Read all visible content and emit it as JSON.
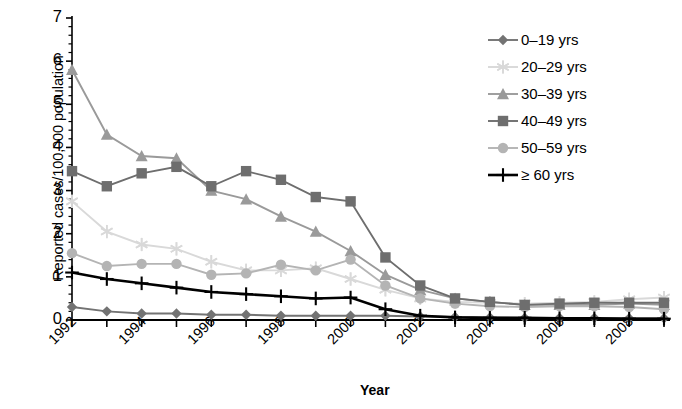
{
  "chart_data": {
    "type": "line",
    "title": "",
    "xlabel": "Year",
    "ylabel": "Reported cases/100,000 population",
    "x": [
      1992,
      1993,
      1994,
      1995,
      1996,
      1997,
      1998,
      1999,
      2000,
      2001,
      2002,
      2003,
      2004,
      2005,
      2006,
      2007,
      2008,
      2009
    ],
    "xlim": [
      1992,
      2009
    ],
    "ylim": [
      0,
      7
    ],
    "yticks": [
      0,
      1,
      2,
      3,
      4,
      5,
      6,
      7
    ],
    "ytick_labels": [
      "0",
      "1",
      "2",
      "3",
      "4",
      "5",
      "6",
      "7"
    ],
    "xtick_labels": [
      "1992",
      "1994",
      "1996",
      "1998",
      "2000",
      "2002",
      "2004",
      "2006",
      "2008"
    ],
    "xtick_values": [
      1992,
      1994,
      1996,
      1998,
      2000,
      2002,
      2004,
      2006,
      2008
    ],
    "minor_ticks": true,
    "grid": false,
    "legend_position": "top-right",
    "series": [
      {
        "name": "0–19 yrs",
        "marker": "diamond",
        "color": "#737373",
        "values": [
          0.3,
          0.2,
          0.15,
          0.15,
          0.12,
          0.12,
          0.1,
          0.1,
          0.1,
          0.1,
          0.08,
          0.07,
          0.06,
          0.05,
          0.05,
          0.05,
          0.04,
          0.04
        ]
      },
      {
        "name": "20–29 yrs",
        "marker": "star",
        "color": "#d9d9d9",
        "values": [
          2.75,
          2.05,
          1.75,
          1.65,
          1.35,
          1.15,
          1.15,
          1.2,
          0.95,
          0.7,
          0.5,
          0.42,
          0.4,
          0.38,
          0.4,
          0.42,
          0.48,
          0.52
        ]
      },
      {
        "name": "30–39 yrs",
        "marker": "triangle",
        "color": "#9a9a9a",
        "values": [
          5.8,
          4.3,
          3.8,
          3.75,
          3.0,
          2.8,
          2.4,
          2.05,
          1.6,
          1.05,
          0.7,
          0.5,
          0.42,
          0.35,
          0.35,
          0.35,
          0.38,
          0.35
        ]
      },
      {
        "name": "40–49 yrs",
        "marker": "square",
        "color": "#6e6e6e",
        "values": [
          3.45,
          3.1,
          3.4,
          3.55,
          3.1,
          3.45,
          3.25,
          2.85,
          2.75,
          1.45,
          0.8,
          0.5,
          0.42,
          0.35,
          0.38,
          0.4,
          0.4,
          0.4
        ]
      },
      {
        "name": "50–59 yrs",
        "marker": "circle",
        "color": "#b4b4b4",
        "values": [
          1.55,
          1.25,
          1.3,
          1.3,
          1.05,
          1.08,
          1.28,
          1.15,
          1.4,
          0.8,
          0.5,
          0.38,
          0.32,
          0.3,
          0.32,
          0.32,
          0.3,
          0.25
        ]
      },
      {
        "name": "≥ 60 yrs",
        "marker": "plus",
        "color": "#000000",
        "values": [
          1.1,
          0.95,
          0.85,
          0.75,
          0.65,
          0.6,
          0.55,
          0.5,
          0.52,
          0.25,
          0.1,
          0.06,
          0.05,
          0.05,
          0.04,
          0.04,
          0.03,
          0.03
        ]
      }
    ]
  },
  "legend": {
    "items": [
      {
        "label": "0–19 yrs"
      },
      {
        "label": "20–29 yrs"
      },
      {
        "label": "30–39 yrs"
      },
      {
        "label": "40–49 yrs"
      },
      {
        "label": "50–59 yrs"
      },
      {
        "label": "≥ 60 yrs"
      }
    ]
  },
  "axes": {
    "y_title": "Reported cases/100,000 population",
    "x_title": "Year"
  }
}
